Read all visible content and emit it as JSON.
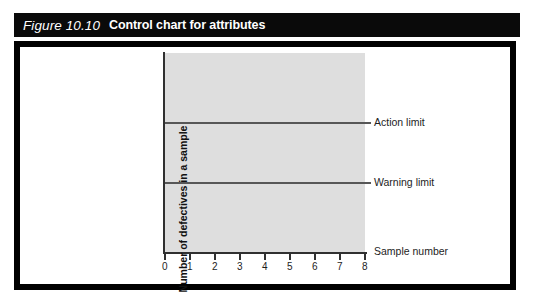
{
  "caption": {
    "figure_number": "Figure 10.10",
    "title": "Control chart for attributes"
  },
  "chart_data": {
    "type": "line",
    "title": "Control chart for attributes",
    "xlabel": "Sample number",
    "ylabel": "Number of defectives in a sample",
    "x_ticks": [
      "0",
      "1",
      "2",
      "3",
      "4",
      "5",
      "6",
      "7",
      "8"
    ],
    "xlim": [
      0,
      8
    ],
    "y_ticks": [],
    "grid": false,
    "legend_position": "right-of-plot",
    "plot_background": "#dedede",
    "series": [
      {
        "name": "Action limit",
        "type": "horizontal-line",
        "value": 0.655,
        "color": "#575757"
      },
      {
        "name": "Warning limit",
        "type": "horizontal-line",
        "value": 0.355,
        "color": "#575757"
      }
    ],
    "annotations": [
      {
        "text": "Action limit",
        "position": "right"
      },
      {
        "text": "Warning limit",
        "position": "right"
      },
      {
        "text": "Sample number",
        "position": "right-of-x-axis"
      }
    ]
  },
  "colors": {
    "frame": "#000000",
    "caption_bar": "#0a0a0a",
    "caption_text": "#ffffff",
    "plot_fill": "#dedede",
    "axis": "#303030",
    "limit_line": "#575757"
  }
}
